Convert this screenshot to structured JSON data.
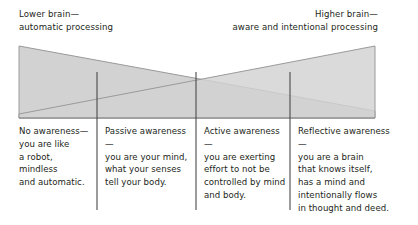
{
  "diagram": {
    "title_left": "Lower brain—\nautomatic processing",
    "title_right": "Higher brain—\naware and intentional processing",
    "columns": [
      {
        "text": "No awareness—\nyou are like\na robot,\nmindless\nand automatic."
      },
      {
        "text": "Passive awareness—\nyou are your mind,\nwhat your senses\ntell your body."
      },
      {
        "text": "Active awareness—\nyou are exerting\neffort to not be\ncontrolled by mind\nand body."
      },
      {
        "text": "Reflective awareness—\nyou are a brain\nthat knows itself,\nhas a mind and\nintentionally flows\nin thought and deed."
      }
    ],
    "colors": {
      "triangle_fill": "#d2d2d2",
      "triangle_stroke": "#9a9a9a",
      "divider": "#4a4a4a",
      "text": "#231f20",
      "background": "#ffffff"
    },
    "geometry": {
      "shape_left_x": 19,
      "shape_right_x": 375,
      "shape_top_y": 46,
      "shape_bottom_y": 118,
      "crossover_x": 196,
      "divider_xs": [
        97,
        196,
        290
      ],
      "divider_top_y": 72,
      "divider_bottom_y": 210
    }
  }
}
